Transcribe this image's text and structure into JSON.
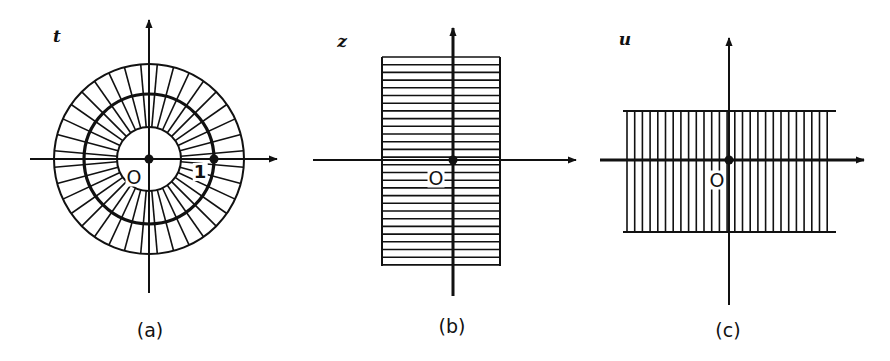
{
  "figure": {
    "panels": [
      {
        "id": "a",
        "caption": "(a)",
        "variable": "t",
        "origin_label": "O",
        "unit_label": "1",
        "description": "Annulus in t-plane, circles radius ~0.5, 1, ~1.5 with radial lines",
        "geometry": {
          "center": [
            149,
            159
          ],
          "r_inner": 32,
          "r_mid": 65,
          "r_outer": 95,
          "radial_lines": 36
        }
      },
      {
        "id": "b",
        "caption": "(b)",
        "variable": "z",
        "origin_label": "O",
        "description": "Vertical strip in z-plane hatched with horizontal lines",
        "geometry": {
          "origin": [
            453,
            160
          ],
          "x_left": 382,
          "x_right": 500,
          "y_top": 57,
          "y_bottom": 265,
          "hatch_spacing": 7.7
        }
      },
      {
        "id": "c",
        "caption": "(c)",
        "variable": "u",
        "origin_label": "O",
        "description": "Horizontal strip in u-plane hatched with vertical lines",
        "geometry": {
          "origin": [
            729,
            160
          ],
          "x_left": 623,
          "x_right": 836,
          "y_top": 111,
          "y_bottom": 232,
          "hatch_spacing": 7.7
        }
      }
    ],
    "colors": {
      "ink": "#111111",
      "background": "#ffffff"
    }
  }
}
